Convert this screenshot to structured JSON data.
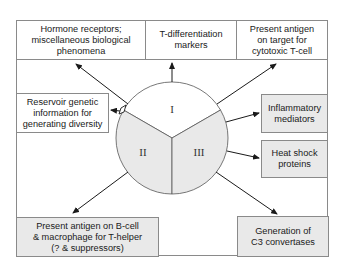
{
  "diagram": {
    "segments": [
      {
        "id": "I",
        "label": "I",
        "fill": "#ffffff"
      },
      {
        "id": "II",
        "label": "II",
        "fill": "#e9e9e9"
      },
      {
        "id": "III",
        "label": "III",
        "fill": "#e9e9e9"
      }
    ],
    "boxes": {
      "hormone": "Hormone receptors;\nmiscellaneous biological\nphenomena",
      "tdiff": "T-differentiation\nmarkers",
      "cytotoxic": "Present antigen\non target for\ncytotoxic T-cell",
      "reservoir": "Reservoir genetic\ninformation for\ngenerating diversity",
      "inflammatory": "Inflammatory\nmediators",
      "heatshock": "Heat shock\nproteins",
      "bcell": "Present antigen on B-cell\n& macrophage for T-helper\n(? & suppressors)",
      "c3": "Generation of\nC3 convertases"
    },
    "colors": {
      "border": "#8a8a8a",
      "shaded": "#e9e9e9",
      "arrow": "#1a1a1a"
    }
  }
}
